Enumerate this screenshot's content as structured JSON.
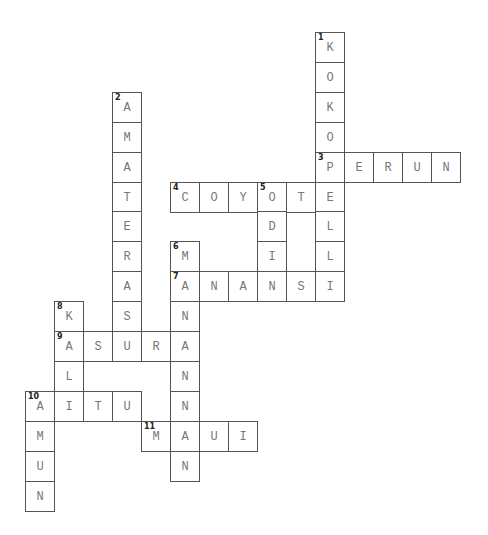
{
  "puzzle": {
    "type": "crossword",
    "grid": {
      "x0": 25,
      "y0": 32,
      "col_w": 29,
      "row_h": 29.9
    },
    "words": [
      {
        "number": 1,
        "direction": "down",
        "answer": "KOKOPELLI",
        "row": 0,
        "col": 10
      },
      {
        "number": 2,
        "direction": "down",
        "answer": "AMATERASU",
        "row": 2,
        "col": 3
      },
      {
        "number": 3,
        "direction": "across",
        "answer": "PERUN",
        "row": 4,
        "col": 10
      },
      {
        "number": 4,
        "direction": "across",
        "answer": "COYOTE",
        "row": 5,
        "col": 5
      },
      {
        "number": 5,
        "direction": "down",
        "answer": "ODIN",
        "row": 5,
        "col": 8
      },
      {
        "number": 6,
        "direction": "down",
        "answer": "MANANNAN",
        "row": 7,
        "col": 5
      },
      {
        "number": 7,
        "direction": "across",
        "answer": "ANANSI",
        "row": 8,
        "col": 5
      },
      {
        "number": 8,
        "direction": "down",
        "answer": "KALI",
        "row": 9,
        "col": 1
      },
      {
        "number": 9,
        "direction": "across",
        "answer": "ASURA",
        "row": 10,
        "col": 1
      },
      {
        "number": 10,
        "direction": "across",
        "answer": "AITU",
        "row": 12,
        "col": 0
      },
      {
        "number": 10,
        "direction": "down",
        "answer": "AMUN",
        "row": 12,
        "col": 0
      },
      {
        "number": 11,
        "direction": "across",
        "answer": "MAUI",
        "row": 13,
        "col": 4
      }
    ]
  }
}
